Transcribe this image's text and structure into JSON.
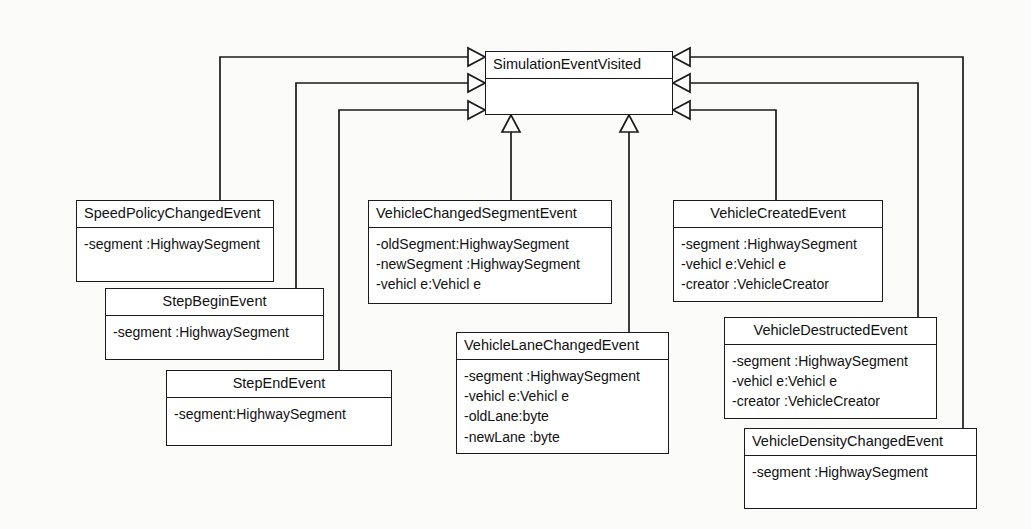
{
  "diagram": {
    "type": "uml-class-diagram",
    "kind": "generalization-hierarchy",
    "base_class": {
      "name": "SimulationEventVisited",
      "attributes": []
    },
    "classes": [
      {
        "id": "speed-policy-changed-event",
        "name": "SpeedPolicyChangedEvent",
        "title_align": "left",
        "attributes": [
          "-segment :HighwaySegment"
        ]
      },
      {
        "id": "step-begin-event",
        "name": "StepBeginEvent",
        "title_align": "center",
        "attributes": [
          "-segment :HighwaySegment"
        ]
      },
      {
        "id": "step-end-event",
        "name": "StepEndEvent",
        "title_align": "center",
        "attributes": [
          "-segment:HighwaySegment"
        ]
      },
      {
        "id": "vehicle-changed-segment-event",
        "name": "VehicleChangedSegmentEvent",
        "title_align": "left",
        "attributes": [
          "-oldSegment:HighwaySegment",
          "-newSegment :HighwaySegment",
          "-vehicl e:Vehicl e"
        ]
      },
      {
        "id": "vehicle-lane-changed-event",
        "name": "VehicleLaneChangedEvent",
        "title_align": "left",
        "attributes": [
          "-segment :HighwaySegment",
          "-vehicl e:Vehicl e",
          "-oldLane:byte",
          "-newLane :byte"
        ]
      },
      {
        "id": "vehicle-created-event",
        "name": "VehicleCreatedEvent",
        "title_align": "center",
        "attributes": [
          "-segment :HighwaySegment",
          "-vehicl e:Vehicl e",
          "-creator :VehicleCreator"
        ]
      },
      {
        "id": "vehicle-destructed-event",
        "name": "VehicleDestructedEvent",
        "title_align": "center",
        "attributes": [
          "-segment :HighwaySegment",
          "-vehicl e:Vehicl e",
          "-creator :VehicleCreator"
        ]
      },
      {
        "id": "vehicle-density-changed-event",
        "name": "VehicleDensityChangedEvent",
        "title_align": "left",
        "attributes": [
          "-segment :HighwaySegment"
        ]
      }
    ],
    "relationships": [
      {
        "from": "SpeedPolicyChangedEvent",
        "to": "SimulationEventVisited",
        "type": "generalization",
        "arrow_side": "left"
      },
      {
        "from": "StepBeginEvent",
        "to": "SimulationEventVisited",
        "type": "generalization",
        "arrow_side": "left"
      },
      {
        "from": "StepEndEvent",
        "to": "SimulationEventVisited",
        "type": "generalization",
        "arrow_side": "left"
      },
      {
        "from": "VehicleChangedSegmentEvent",
        "to": "SimulationEventVisited",
        "type": "generalization",
        "arrow_side": "bottom"
      },
      {
        "from": "VehicleLaneChangedEvent",
        "to": "SimulationEventVisited",
        "type": "generalization",
        "arrow_side": "bottom"
      },
      {
        "from": "VehicleCreatedEvent",
        "to": "SimulationEventVisited",
        "type": "generalization",
        "arrow_side": "right"
      },
      {
        "from": "VehicleDestructedEvent",
        "to": "SimulationEventVisited",
        "type": "generalization",
        "arrow_side": "right"
      },
      {
        "from": "VehicleDensityChangedEvent",
        "to": "SimulationEventVisited",
        "type": "generalization",
        "arrow_side": "right"
      }
    ],
    "colors": {
      "page_background": "#fbfbf9",
      "box_fill": "#ffffff",
      "stroke": "#1b1b1b",
      "text": "#111111"
    }
  }
}
